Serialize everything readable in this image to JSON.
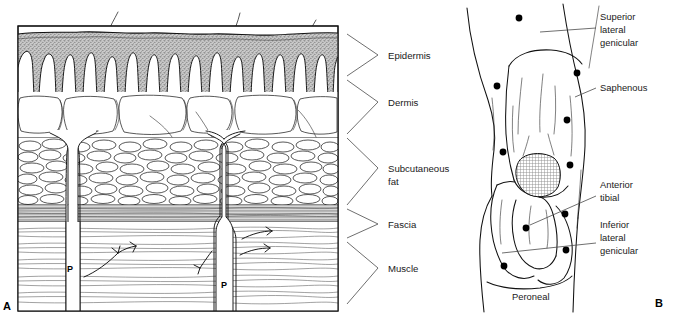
{
  "figure": {
    "panels": [
      {
        "letter": "A",
        "name": "skin-cross-section",
        "description": "Cross-section of skin showing layers with perforating vessels",
        "vessel_markers": [
          {
            "label": "P",
            "x": 70,
            "y": 272
          },
          {
            "label": "P",
            "x": 222,
            "y": 288
          }
        ],
        "labels": [
          {
            "text": "Epidermis",
            "x": 388,
            "y": 59,
            "leader_from_x": 347,
            "leader_from_y": 34,
            "leader_mid_x": 378,
            "leader_mid_y": 55,
            "leader_to_x": 347,
            "leader_to_y": 76
          },
          {
            "text": "Dermis",
            "x": 388,
            "y": 106,
            "leader_from_x": 347,
            "leader_from_y": 80,
            "leader_mid_x": 378,
            "leader_mid_y": 102,
            "leader_to_x": 347,
            "leader_to_y": 134
          },
          {
            "text": "Subcutaneous",
            "x": 388,
            "y": 172,
            "leader_from_x": 347,
            "leader_from_y": 138,
            "leader_mid_x": 378,
            "leader_mid_y": 168,
            "leader_to_x": 347,
            "leader_to_y": 205
          },
          {
            "text": "fat",
            "x": 388,
            "y": 185
          },
          {
            "text": "Fascia",
            "x": 388,
            "y": 228,
            "leader_from_x": 347,
            "leader_from_y": 209,
            "leader_mid_x": 378,
            "leader_mid_y": 224,
            "leader_to_x": 347,
            "leader_to_y": 238
          },
          {
            "text": "Muscle",
            "x": 388,
            "y": 272,
            "leader_from_x": 347,
            "leader_from_y": 242,
            "leader_mid_x": 378,
            "leader_mid_y": 268,
            "leader_to_x": 347,
            "leader_to_y": 304
          }
        ],
        "layer_names": [
          "Epidermis",
          "Dermis",
          "Subcutaneous fat",
          "Fascia",
          "Muscle"
        ],
        "hairs": 3
      },
      {
        "letter": "B",
        "name": "knee-nerve-block-sites",
        "description": "Anterior view of knee showing nerve territories and injection points",
        "labels": [
          {
            "text": "Superior",
            "x": 600,
            "y": 20
          },
          {
            "text": "lateral",
            "x": 600,
            "y": 33
          },
          {
            "text": "genicular",
            "x": 600,
            "y": 46
          },
          {
            "text": "Saphenous",
            "x": 600,
            "y": 91
          },
          {
            "text": "Anterior",
            "x": 600,
            "y": 188
          },
          {
            "text": "tibial",
            "x": 600,
            "y": 201
          },
          {
            "text": "Inferior",
            "x": 600,
            "y": 228
          },
          {
            "text": "lateral",
            "x": 600,
            "y": 241
          },
          {
            "text": "genicular",
            "x": 600,
            "y": 254
          },
          {
            "text": "Peroneal",
            "x": 512,
            "y": 300
          }
        ],
        "leaders": [
          {
            "name": "superior-lateral-genicular-leader",
            "x1": 540,
            "y1": 32,
            "x2": 596,
            "y2": 28
          },
          {
            "name": "saphenous-leader",
            "x1": 575,
            "y1": 97,
            "x2": 596,
            "y2": 88
          },
          {
            "name": "anterior-tibial-leader",
            "x1": 530,
            "y1": 225,
            "x2": 596,
            "y2": 196
          },
          {
            "name": "inferior-lateral-genicular-leader",
            "x1": 502,
            "y1": 253,
            "x2": 596,
            "y2": 243
          }
        ],
        "injection_points": [
          {
            "x": 519,
            "y": 18
          },
          {
            "x": 577,
            "y": 73
          },
          {
            "x": 497,
            "y": 86
          },
          {
            "x": 567,
            "y": 120
          },
          {
            "x": 503,
            "y": 152
          },
          {
            "x": 570,
            "y": 165
          },
          {
            "x": 565,
            "y": 214
          },
          {
            "x": 526,
            "y": 228
          },
          {
            "x": 566,
            "y": 250
          },
          {
            "x": 504,
            "y": 266
          }
        ],
        "patella": {
          "cx": 535,
          "cy": 176,
          "rx": 22,
          "ry": 21
        },
        "nerve_names": [
          "Superior lateral genicular",
          "Saphenous",
          "Anterior tibial",
          "Inferior lateral genicular",
          "Peroneal"
        ]
      }
    ]
  },
  "colors": {
    "ink": "#111111",
    "epidermis_fill": "#a8a8a8",
    "leader": "#4a4a4a",
    "background": "#ffffff"
  }
}
